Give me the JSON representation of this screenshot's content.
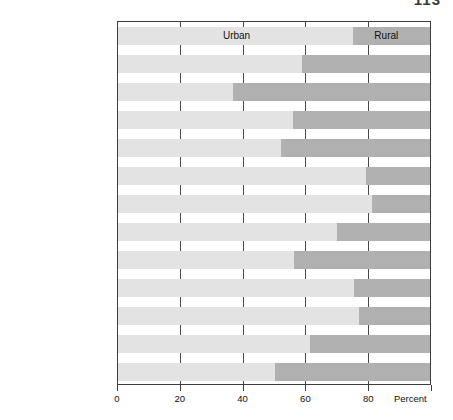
{
  "page": {
    "number": "113"
  },
  "chart_data": {
    "type": "bar",
    "orientation": "horizontal",
    "stacked": true,
    "title": "",
    "xlabel": "Percent",
    "ylabel": "",
    "xlim": [
      0,
      100
    ],
    "xticks": [
      0,
      20,
      40,
      60,
      80
    ],
    "xticklabels": [
      "0",
      "20",
      "40",
      "60",
      "80"
    ],
    "grid": "vertical",
    "legend_position": "in-plot-first-row",
    "categories": [
      "Total, Canada",
      "Newfoundland",
      "Prince Edward Island",
      "Nova Scotia",
      "New Brunswick",
      "Québec",
      "Ontario",
      "Manitoba",
      "Saskatchewan",
      "Alberta",
      "British Columbia",
      "Yukon",
      "Northwest Territory"
    ],
    "series": [
      {
        "name": "Urban",
        "color": "#e3e3e3",
        "values": [
          75.4,
          59.0,
          36.9,
          56.1,
          52.2,
          79.4,
          81.4,
          70.1,
          56.4,
          75.7,
          77.4,
          61.6,
          50.2
        ]
      },
      {
        "name": "Rural",
        "color": "#b1b1b1",
        "values": [
          24.6,
          41.0,
          63.1,
          43.9,
          47.8,
          20.6,
          18.6,
          29.9,
          43.6,
          24.3,
          22.6,
          38.4,
          49.8
        ]
      }
    ],
    "annotations": [
      {
        "text": "Urban",
        "row": 0,
        "x": 38
      },
      {
        "text": "Rural",
        "row": 0,
        "x": 86
      }
    ]
  }
}
